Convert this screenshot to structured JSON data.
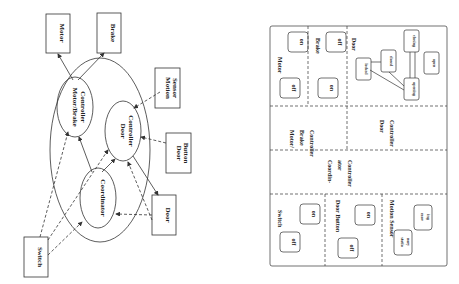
{
  "left": {
    "boxes": {
      "motor": "Motor",
      "brake": "Brake",
      "motion_sensor": [
        "Motion",
        "Sensor"
      ],
      "door_button": [
        "Door",
        "Button"
      ],
      "door": "Door",
      "switch": "Switch"
    },
    "ellipses": {
      "motor_brake": [
        "Motor/Brake",
        "Controller"
      ],
      "door_ctrl": [
        "Door",
        "Controller"
      ],
      "coordinator": "Coordinator"
    }
  },
  "right": {
    "motor": {
      "title": "Motor",
      "states": [
        "off",
        "on"
      ]
    },
    "brake": {
      "title": "Brake",
      "states": [
        "on",
        "off"
      ]
    },
    "door": {
      "title": "Door",
      "states": [
        "locked",
        "closed",
        "closing",
        "opening",
        "open"
      ]
    },
    "mb_ctrl": [
      "Motor/",
      "Brake",
      "Controller"
    ],
    "door_ctrl": [
      "Door",
      "Controller"
    ],
    "coord_ctrl": [
      "Coordin-",
      "ator",
      "Controller"
    ],
    "switch": {
      "title": "Switch",
      "states": [
        "off",
        "on"
      ]
    },
    "door_button": {
      "title": "Door Button",
      "states": [
        "off",
        "on"
      ]
    },
    "motion_sensor": {
      "title": "Motion Sensor",
      "states": [
        [
          "statio",
          "nary"
        ],
        [
          "mov",
          "ing"
        ]
      ]
    }
  }
}
